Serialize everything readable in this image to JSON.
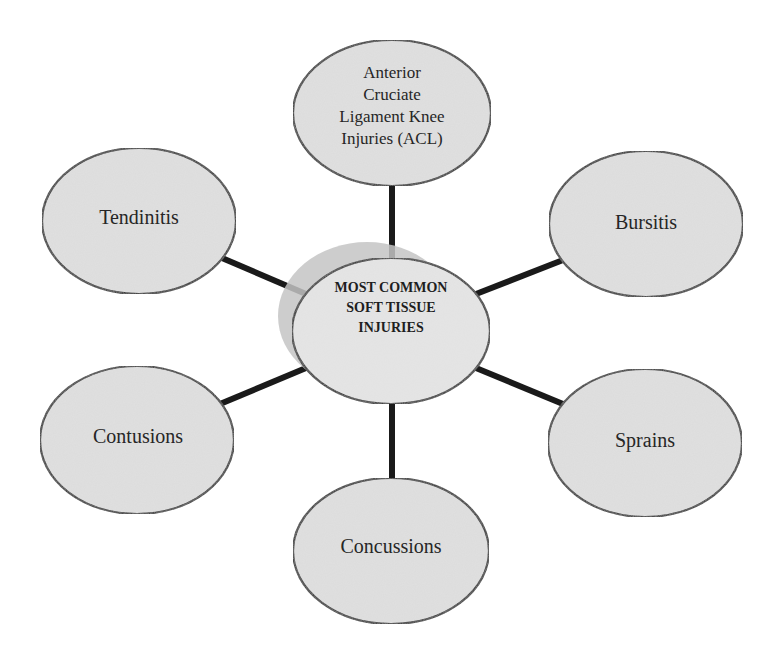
{
  "diagram": {
    "type": "hub-and-spoke",
    "center": {
      "lines": [
        "MOST COMMON",
        "SOFT TISSUE",
        "INJURIES"
      ]
    },
    "nodes": [
      {
        "id": "acl",
        "lines": [
          "Anterior",
          "Cruciate",
          "Ligament Knee",
          "Injuries (ACL)"
        ]
      },
      {
        "id": "bursitis",
        "label": "Bursitis"
      },
      {
        "id": "sprains",
        "label": "Sprains"
      },
      {
        "id": "concussions",
        "label": "Concussions"
      },
      {
        "id": "contusions",
        "label": "Contusions"
      },
      {
        "id": "tendinitis",
        "label": "Tendinitis"
      }
    ],
    "colors": {
      "node_fill": "#dcdcdc",
      "node_stroke": "#1f1f1f",
      "center_shadow": "#c4c4c4",
      "connector": "#1a1a1a",
      "text": "#262626",
      "background": "#ffffff"
    }
  }
}
